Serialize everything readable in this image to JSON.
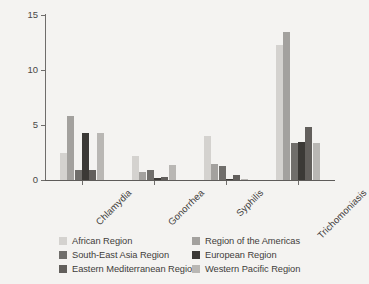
{
  "chart_data": {
    "type": "bar",
    "title": "",
    "subtitle": "",
    "xlabel": "",
    "ylabel": "Prevalence rate, %",
    "ylim": [
      0,
      15
    ],
    "yticks": [
      0,
      5,
      10,
      15
    ],
    "ytick_labels": [
      "0",
      "5",
      "10",
      "15"
    ],
    "grid": false,
    "legend_position": "below-plot",
    "xtick_rotation": -45,
    "categories": [
      "Chlamydia",
      "Gonorrhea",
      "Syphilis",
      "Trichomoniasis"
    ],
    "series": [
      {
        "name": "African Region",
        "color": "#d4d2cf",
        "values": [
          2.5,
          2.2,
          4.0,
          12.3
        ]
      },
      {
        "name": "Region of the Americas",
        "color": "#a3a19e",
        "values": [
          5.8,
          0.7,
          1.5,
          13.5
        ]
      },
      {
        "name": "South-East Asia Region",
        "color": "#706e6b",
        "values": [
          0.9,
          0.95,
          1.3,
          3.35
        ]
      },
      {
        "name": "European Region",
        "color": "#3b3936",
        "values": [
          4.3,
          0.15,
          0.05,
          3.45
        ]
      },
      {
        "name": "Eastern Mediterranean Region",
        "color": "#625f5c",
        "values": [
          0.95,
          0.3,
          0.5,
          4.8
        ]
      },
      {
        "name": "Western Pacific Region",
        "color": "#b9b7b4",
        "values": [
          4.25,
          1.4,
          0.1,
          3.35
        ]
      }
    ]
  },
  "axis": {
    "y_label": "Prevalence rate, %",
    "y_ticks": [
      "15",
      "10",
      "5",
      "0"
    ]
  },
  "x_categories": {
    "c0": "Chlamydia",
    "c1": "Gonorrhea",
    "c2": "Syphilis",
    "c3": "Trichomoniasis"
  },
  "legend": {
    "entries": [
      {
        "label": "African Region",
        "color": "#d4d2cf"
      },
      {
        "label": "Region of the Americas",
        "color": "#a3a19e"
      },
      {
        "label": "South-East Asia Region",
        "color": "#706e6b"
      },
      {
        "label": "European Region",
        "color": "#3b3936"
      },
      {
        "label": "Eastern Mediterranean Region",
        "color": "#625f5c"
      },
      {
        "label": "Western Pacific Region",
        "color": "#b9b7b4"
      }
    ]
  }
}
